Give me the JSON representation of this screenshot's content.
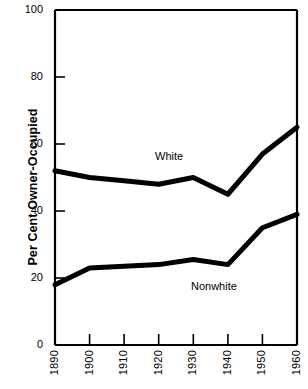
{
  "chart_data": {
    "type": "line",
    "title": "",
    "xlabel": "",
    "ylabel": "Per Cent Owner-Occupied",
    "xlim": [
      1890,
      1960
    ],
    "ylim": [
      0,
      100
    ],
    "grid": false,
    "legend_position": "inline-annotation",
    "x": [
      1890,
      1900,
      1910,
      1920,
      1930,
      1940,
      1950,
      1960
    ],
    "xtick_labels": [
      "1890",
      "1900",
      "1910",
      "1920",
      "1930",
      "1940",
      "1950",
      "1960"
    ],
    "ytick_labels": [
      "0",
      "20",
      "40",
      "60",
      "80",
      "100"
    ],
    "ytick_values": [
      0,
      20,
      40,
      60,
      80,
      100
    ],
    "series": [
      {
        "name": "White",
        "values": [
          52,
          50,
          49,
          48,
          50,
          45,
          57,
          65
        ],
        "color": "#000000",
        "line_width": 5,
        "annotation": {
          "text": "White",
          "x": 1926,
          "y": 57
        }
      },
      {
        "name": "Nonwhite",
        "values": [
          18,
          23,
          23.5,
          24,
          25.5,
          24,
          35,
          39
        ],
        "color": "#000000",
        "line_width": 5,
        "annotation": {
          "text": "Nonwhite",
          "x": 1942,
          "y": 18
        }
      }
    ]
  },
  "axes": {
    "frame_color": "#000000",
    "tick_color": "#000000"
  }
}
